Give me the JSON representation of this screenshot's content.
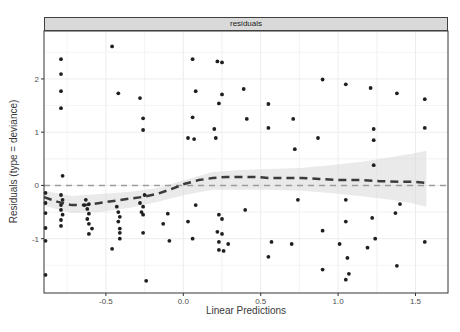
{
  "strip": {
    "label": "residuals"
  },
  "axes": {
    "x_label": "Linear Predictions",
    "y_label": "Residuals (type = deviance)",
    "x_tick_labels": [
      "-0.5",
      "0.0",
      "0.5",
      "1.0",
      "1.5"
    ],
    "y_tick_labels": [
      "-1",
      "0",
      "1",
      "2"
    ]
  },
  "colors": {
    "point": "#1f1f1f",
    "smoother": "#3b3b3b",
    "reference_line": "#9c9c9c",
    "ribbon": "#d8d8d8",
    "strip_bg": "#d9d9d9",
    "panel_border": "#343434",
    "grid_major": "#ececec",
    "grid_minor": "#f5f5f5",
    "tick": "#333333",
    "tick_label": "#4d4d4d"
  },
  "chart_data": {
    "type": "scatter",
    "title": "residuals",
    "xlabel": "Linear Predictions",
    "ylabel": "Residuals (type = deviance)",
    "legend": "none",
    "grid": "light-major-minor",
    "x_domain": [
      -0.9,
      1.71
    ],
    "y_domain": [
      -2.02,
      2.9
    ],
    "x_tick_values": [
      -0.5,
      0.0,
      0.5,
      1.0,
      1.5
    ],
    "y_tick_values": [
      -1,
      0,
      1,
      2
    ],
    "reference_line_y": 0,
    "layout": {
      "panel": {
        "left": 44,
        "top": 31,
        "right": 448,
        "bottom": 293
      }
    },
    "points": [
      [
        -0.46,
        2.61
      ],
      [
        -0.79,
        2.37
      ],
      [
        -0.79,
        2.09
      ],
      [
        -0.79,
        1.77
      ],
      [
        -0.42,
        1.73
      ],
      [
        -0.28,
        1.64
      ],
      [
        -0.79,
        1.45
      ],
      [
        -0.26,
        1.26
      ],
      [
        -0.26,
        1.04
      ],
      [
        0.06,
        2.37
      ],
      [
        0.22,
        2.33
      ],
      [
        0.25,
        2.31
      ],
      [
        0.08,
        1.77
      ],
      [
        0.25,
        1.71
      ],
      [
        0.39,
        1.81
      ],
      [
        0.23,
        1.54
      ],
      [
        0.06,
        1.28
      ],
      [
        0.41,
        1.25
      ],
      [
        0.2,
        1.06
      ],
      [
        0.03,
        0.89
      ],
      [
        0.07,
        0.87
      ],
      [
        0.21,
        0.89
      ],
      [
        0.9,
        1.99
      ],
      [
        0.55,
        1.53
      ],
      [
        0.71,
        1.25
      ],
      [
        0.55,
        1.08
      ],
      [
        0.87,
        0.89
      ],
      [
        0.72,
        0.68
      ],
      [
        1.05,
        1.9
      ],
      [
        1.21,
        1.83
      ],
      [
        1.38,
        1.73
      ],
      [
        1.56,
        1.62
      ],
      [
        1.23,
        1.06
      ],
      [
        1.56,
        1.08
      ],
      [
        1.23,
        0.85
      ],
      [
        -0.78,
        0.18
      ],
      [
        -0.79,
        -0.18
      ],
      [
        -0.78,
        -0.27
      ],
      [
        -0.79,
        -0.37
      ],
      [
        -0.79,
        -0.46
      ],
      [
        -0.78,
        -0.55
      ],
      [
        -0.79,
        -0.65
      ],
      [
        -0.79,
        -0.76
      ],
      [
        -0.89,
        -0.14
      ],
      [
        -0.89,
        -0.33
      ],
      [
        -0.89,
        -0.52
      ],
      [
        -0.89,
        -0.8
      ],
      [
        -0.89,
        -1.04
      ],
      [
        -0.89,
        -1.68
      ],
      [
        -0.63,
        -0.27
      ],
      [
        -0.61,
        -0.35
      ],
      [
        -0.64,
        -0.37
      ],
      [
        -0.62,
        -0.44
      ],
      [
        -0.61,
        -0.53
      ],
      [
        -0.62,
        -0.63
      ],
      [
        -0.61,
        -0.72
      ],
      [
        -0.59,
        -0.81
      ],
      [
        -0.61,
        -0.91
      ],
      [
        -0.43,
        -0.4
      ],
      [
        -0.42,
        -0.5
      ],
      [
        -0.41,
        -0.59
      ],
      [
        -0.42,
        -0.68
      ],
      [
        -0.41,
        -0.81
      ],
      [
        -0.41,
        -0.89
      ],
      [
        -0.41,
        -1.0
      ],
      [
        -0.28,
        -0.33
      ],
      [
        -0.26,
        -0.4
      ],
      [
        -0.27,
        -0.5
      ],
      [
        -0.26,
        -0.55
      ],
      [
        -0.26,
        -0.89
      ],
      [
        -0.24,
        -1.79
      ],
      [
        -0.25,
        -0.18
      ],
      [
        -0.46,
        -1.19
      ],
      [
        0.08,
        -0.37
      ],
      [
        -0.1,
        -0.53
      ],
      [
        0.23,
        -0.55
      ],
      [
        0.25,
        -0.63
      ],
      [
        -0.13,
        -0.72
      ],
      [
        0.03,
        -0.68
      ],
      [
        0.22,
        -0.87
      ],
      [
        0.25,
        -0.91
      ],
      [
        0.23,
        -1.06
      ],
      [
        0.29,
        -1.1
      ],
      [
        0.23,
        -1.21
      ],
      [
        0.26,
        -1.23
      ],
      [
        -0.09,
        -1.04
      ],
      [
        0.06,
        -1.0
      ],
      [
        0.4,
        -0.46
      ],
      [
        0.74,
        -0.27
      ],
      [
        1.05,
        -0.27
      ],
      [
        1.05,
        -0.68
      ],
      [
        0.9,
        -0.85
      ],
      [
        0.57,
        -1.06
      ],
      [
        0.7,
        -1.1
      ],
      [
        0.55,
        -1.34
      ],
      [
        0.9,
        -1.58
      ],
      [
        1.01,
        -1.1
      ],
      [
        1.06,
        -1.36
      ],
      [
        1.07,
        -1.66
      ],
      [
        1.05,
        -1.77
      ],
      [
        1.23,
        0.38
      ],
      [
        1.4,
        -0.35
      ],
      [
        1.22,
        -0.61
      ],
      [
        1.37,
        -0.52
      ],
      [
        1.24,
        -1.0
      ],
      [
        1.56,
        -1.06
      ],
      [
        1.19,
        -1.17
      ],
      [
        1.38,
        -1.51
      ]
    ],
    "smoother": {
      "x": [
        -0.9,
        -0.81,
        -0.72,
        -0.63,
        -0.54,
        -0.45,
        -0.35,
        -0.27,
        -0.17,
        -0.08,
        0.01,
        0.1,
        0.19,
        0.28,
        0.37,
        0.46,
        0.55,
        0.64,
        0.76,
        0.88,
        1.01,
        1.14,
        1.27,
        1.4,
        1.48,
        1.56
      ],
      "y": [
        -0.22,
        -0.31,
        -0.37,
        -0.37,
        -0.33,
        -0.29,
        -0.25,
        -0.22,
        -0.16,
        -0.07,
        0.03,
        0.1,
        0.14,
        0.16,
        0.16,
        0.16,
        0.14,
        0.14,
        0.14,
        0.12,
        0.1,
        0.1,
        0.08,
        0.07,
        0.07,
        0.05
      ]
    },
    "ribbon": {
      "x": [
        -0.9,
        -0.72,
        -0.54,
        -0.34,
        -0.17,
        0.01,
        0.19,
        0.37,
        0.55,
        0.76,
        0.95,
        1.14,
        1.34,
        1.47,
        1.57
      ],
      "upper": [
        -0.1,
        -0.2,
        -0.16,
        -0.12,
        -0.05,
        0.1,
        0.25,
        0.29,
        0.31,
        0.33,
        0.38,
        0.44,
        0.53,
        0.59,
        0.65
      ],
      "lower": [
        -0.38,
        -0.52,
        -0.5,
        -0.42,
        -0.31,
        -0.18,
        -0.08,
        -0.08,
        -0.08,
        -0.1,
        -0.14,
        -0.2,
        -0.27,
        -0.33,
        -0.4
      ]
    }
  }
}
